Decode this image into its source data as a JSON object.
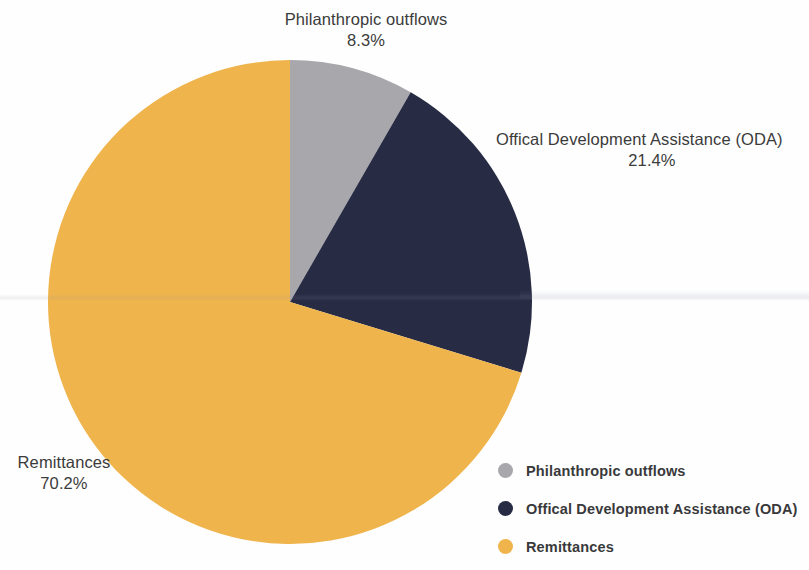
{
  "chart_data": {
    "type": "pie",
    "title": "",
    "categories": [
      "Philanthropic outflows",
      "Offical Development Assistance (ODA)",
      "Remittances"
    ],
    "values": [
      8.3,
      21.4,
      70.2
    ],
    "value_labels": [
      "8.3%",
      "21.4%",
      "70.2%"
    ],
    "units": "percent",
    "start_angle_deg": 0,
    "direction": "clockwise",
    "legend_position": "bottom-right",
    "grid": false,
    "colors": [
      "#a8a8ac",
      "#272b44",
      "#efb44c"
    ],
    "slices": [
      {
        "name": "Philanthropic outflows",
        "value": 8.3,
        "label": "8.3%",
        "color": "#a8a8ac",
        "start_deg": 0,
        "end_deg": 29.88
      },
      {
        "name": "Offical Development Assistance (ODA)",
        "value": 21.4,
        "label": "21.4%",
        "color": "#272b44",
        "start_deg": 29.88,
        "end_deg": 106.92
      },
      {
        "name": "Remittances",
        "value": 70.2,
        "label": "70.2%",
        "color": "#efb44c",
        "start_deg": 106.92,
        "end_deg": 360
      }
    ]
  },
  "callouts": {
    "philanthropic": {
      "name": "Philanthropic outflows",
      "percent": "8.3%"
    },
    "oda": {
      "name": "Offical Development Assistance (ODA)",
      "percent": "21.4%"
    },
    "remittances": {
      "name": "Remittances",
      "percent": "70.2%"
    }
  },
  "legend": {
    "items": [
      {
        "label": "Philanthropic outflows",
        "color": "#a8a8ac"
      },
      {
        "label": "Offical Development Assistance (ODA)",
        "color": "#272b44"
      },
      {
        "label": "Remittances",
        "color": "#efb44c"
      }
    ]
  }
}
